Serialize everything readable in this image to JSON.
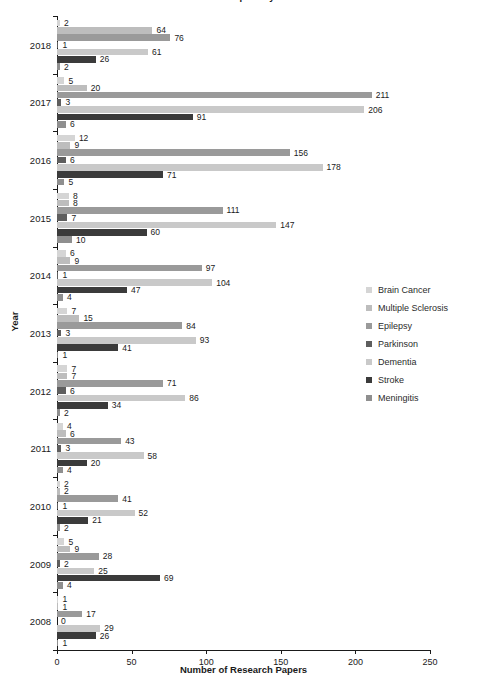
{
  "chart_data": {
    "type": "bar",
    "orientation": "horizontal",
    "title": "Number of Research Papers by Disease and Year",
    "xlabel": "Number of Research Papers",
    "ylabel": "Year",
    "xlim": [
      0,
      250
    ],
    "xticks": [
      "0",
      "50",
      "100",
      "150",
      "200",
      "250"
    ],
    "grid": false,
    "legend_position": "right",
    "categories": [
      "2018",
      "2017",
      "2016",
      "2015",
      "2014",
      "2013",
      "2012",
      "2011",
      "2010",
      "2009",
      "2008"
    ],
    "series": [
      {
        "name": "Brain Cancer",
        "color": "#d5d5d5",
        "values": [
          2,
          5,
          12,
          8,
          6,
          7,
          7,
          4,
          2,
          5,
          1
        ]
      },
      {
        "name": "Multiple Sclerosis",
        "color": "#bdbdbd",
        "values": [
          64,
          20,
          9,
          8,
          9,
          15,
          7,
          6,
          2,
          9,
          1
        ]
      },
      {
        "name": "Epilepsy",
        "color": "#9a9a9a",
        "values": [
          76,
          211,
          156,
          111,
          97,
          84,
          71,
          43,
          41,
          28,
          17
        ]
      },
      {
        "name": "Parkinson",
        "color": "#5e5e5e",
        "values": [
          1,
          3,
          6,
          7,
          1,
          3,
          6,
          3,
          1,
          2,
          0
        ]
      },
      {
        "name": "Dementia",
        "color": "#c9c9c9",
        "values": [
          61,
          206,
          178,
          147,
          104,
          93,
          86,
          58,
          52,
          25,
          29
        ]
      },
      {
        "name": "Stroke",
        "color": "#3b3b3b",
        "values": [
          26,
          91,
          71,
          60,
          47,
          41,
          34,
          20,
          21,
          69,
          26
        ]
      },
      {
        "name": "Meningitis",
        "color": "#8f8f8f",
        "values": [
          2,
          6,
          5,
          10,
          4,
          1,
          2,
          4,
          2,
          4,
          1
        ]
      }
    ]
  },
  "axis": {
    "y_title": "Year",
    "x_title": "Number of Research Papers"
  }
}
